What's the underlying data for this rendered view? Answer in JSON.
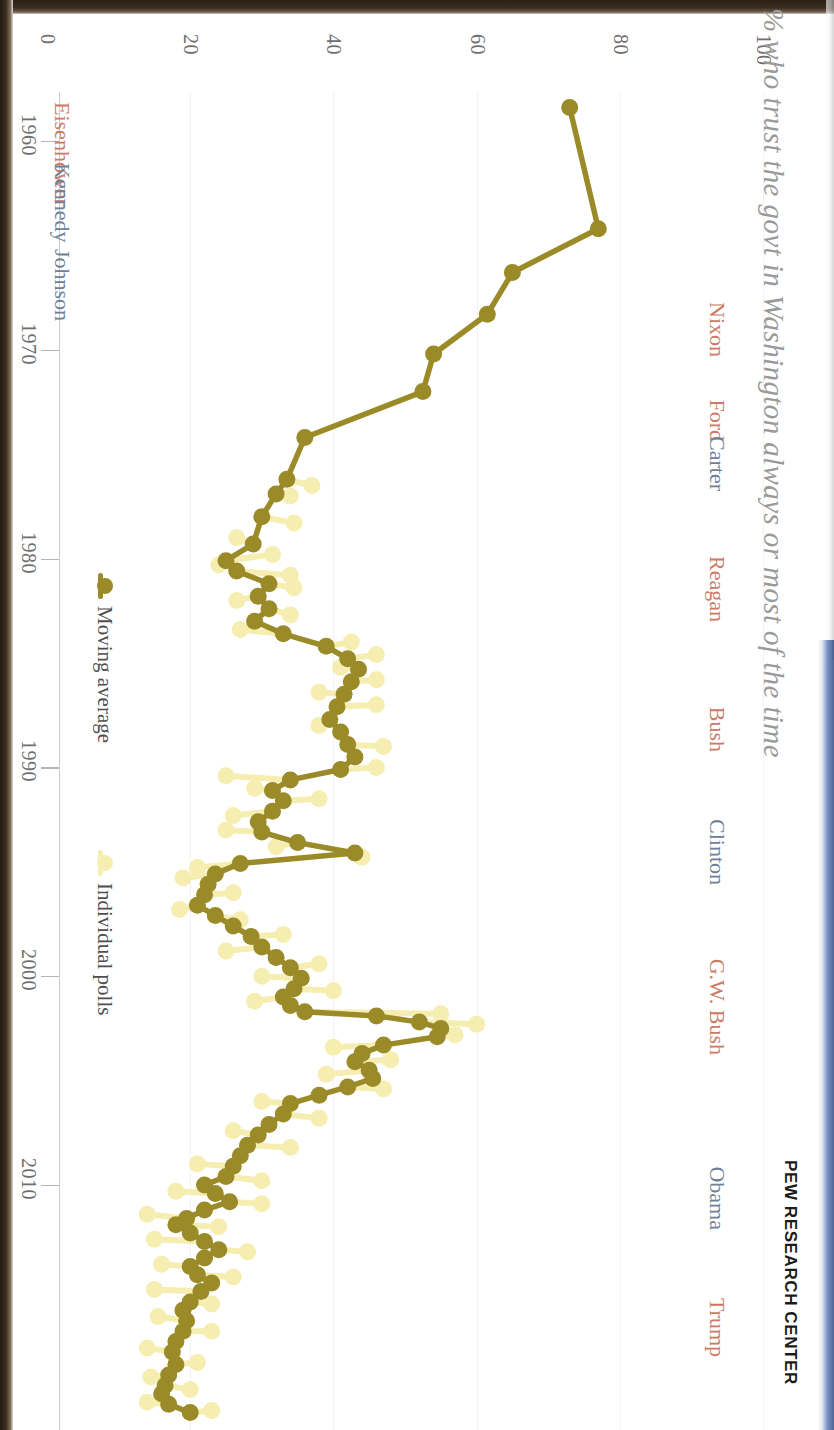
{
  "title": "% who trust the govt in Washington always or most of the time",
  "brand": "PEW RESEARCH CENTER",
  "axes": {
    "pct_ticks": [
      "0",
      "20",
      "40",
      "60",
      "80",
      "100"
    ],
    "year_ticks": [
      "1960",
      "1970",
      "1980",
      "1990",
      "2000",
      "2010"
    ]
  },
  "legend": [
    {
      "label": "Moving average",
      "color": "#9a8a28"
    },
    {
      "label": "Individual polls",
      "color": "#f5eeb0"
    }
  ],
  "presidents": [
    {
      "name": "Eisenhower",
      "party": "rep",
      "color": "#cc7a66",
      "side": "left",
      "year": 1959.4
    },
    {
      "name": "Kennedy",
      "party": "dem",
      "color": "#6e8199",
      "side": "left",
      "year": 1962.3
    },
    {
      "name": "Johnson",
      "party": "dem",
      "color": "#6e8199",
      "side": "left",
      "year": 1966.4
    },
    {
      "name": "Nixon",
      "party": "rep",
      "color": "#cc7a66",
      "side": "right",
      "year": 1971.6
    },
    {
      "name": "Ford",
      "party": "rep",
      "color": "#cc7a66",
      "side": "right",
      "year": 1975.6
    },
    {
      "name": "Carter",
      "party": "dem",
      "color": "#6e8199",
      "side": "right",
      "year": 1978.0
    },
    {
      "name": "Reagan",
      "party": "rep",
      "color": "#cc7a66",
      "side": "right",
      "year": 1984.3
    },
    {
      "name": "Bush",
      "party": "rep",
      "color": "#cc7a66",
      "side": "right",
      "year": 1990.5
    },
    {
      "name": "Clinton",
      "party": "dem",
      "color": "#6e8199",
      "side": "right",
      "year": 1996.9
    },
    {
      "name": "G.W. Bush",
      "party": "rep",
      "color": "#cc7a66",
      "side": "right",
      "year": 2005.0
    },
    {
      "name": "Obama",
      "party": "dem",
      "color": "#6e8199",
      "side": "right",
      "year": 2013.4
    },
    {
      "name": "Trump",
      "party": "rep",
      "color": "#cc7a66",
      "side": "right",
      "year": 2019.5
    }
  ],
  "chart_data": {
    "type": "line",
    "orientation": "rotated-90-clockwise",
    "title": "% who trust the govt in Washington always or most of the time",
    "xlabel": "Year",
    "ylabel": "% who trust the government",
    "xlim": [
      1958,
      2021
    ],
    "ylim": [
      0,
      100
    ],
    "grid": false,
    "legend_position": "left-inside",
    "colors": {
      "moving_average": "#9a8a28",
      "individual_polls": "#f5eeb0",
      "republican_label": "#cc7a66",
      "democrat_label": "#6e8199",
      "axis_text": "#6f6f6f",
      "title_text": "#9a9a9a"
    },
    "series": [
      {
        "name": "Moving average",
        "color": "#9a8a28",
        "points": [
          [
            1958.4,
            73.0
          ],
          [
            1964.2,
            77.0
          ],
          [
            1966.3,
            65.0
          ],
          [
            1968.3,
            61.5
          ],
          [
            1970.2,
            54.0
          ],
          [
            1972.0,
            52.5
          ],
          [
            1974.2,
            36.0
          ],
          [
            1976.2,
            33.5
          ],
          [
            1976.9,
            32.0
          ],
          [
            1978.0,
            30.0
          ],
          [
            1979.3,
            28.8
          ],
          [
            1980.1,
            25.0
          ],
          [
            1980.6,
            26.5
          ],
          [
            1981.2,
            31.0
          ],
          [
            1981.8,
            29.5
          ],
          [
            1982.4,
            31.0
          ],
          [
            1983.0,
            29.0
          ],
          [
            1983.6,
            33.0
          ],
          [
            1984.2,
            39.0
          ],
          [
            1984.8,
            42.0
          ],
          [
            1985.3,
            43.5
          ],
          [
            1985.9,
            42.5
          ],
          [
            1986.5,
            41.5
          ],
          [
            1987.1,
            40.5
          ],
          [
            1987.7,
            39.5
          ],
          [
            1988.3,
            41.0
          ],
          [
            1988.9,
            42.0
          ],
          [
            1989.5,
            43.0
          ],
          [
            1990.1,
            41.0
          ],
          [
            1990.6,
            34.0
          ],
          [
            1991.1,
            31.5
          ],
          [
            1991.6,
            33.0
          ],
          [
            1992.1,
            31.5
          ],
          [
            1992.6,
            29.5
          ],
          [
            1993.1,
            30.0
          ],
          [
            1993.6,
            35.0
          ],
          [
            1994.1,
            43.0
          ],
          [
            1994.6,
            27.0
          ],
          [
            1995.1,
            23.5
          ],
          [
            1995.6,
            22.5
          ],
          [
            1996.1,
            22.0
          ],
          [
            1996.6,
            21.0
          ],
          [
            1997.1,
            23.5
          ],
          [
            1997.6,
            26.0
          ],
          [
            1998.1,
            28.5
          ],
          [
            1998.6,
            30.0
          ],
          [
            1999.1,
            32.0
          ],
          [
            1999.6,
            34.0
          ],
          [
            2000.1,
            35.5
          ],
          [
            2000.6,
            34.5
          ],
          [
            2001.0,
            33.0
          ],
          [
            2001.4,
            34.0
          ],
          [
            2001.7,
            36.0
          ],
          [
            2001.9,
            46.0
          ],
          [
            2002.2,
            52.0
          ],
          [
            2002.5,
            55.0
          ],
          [
            2002.9,
            54.5
          ],
          [
            2003.3,
            47.0
          ],
          [
            2003.7,
            44.0
          ],
          [
            2004.1,
            43.0
          ],
          [
            2004.5,
            45.0
          ],
          [
            2004.9,
            45.5
          ],
          [
            2005.3,
            42.0
          ],
          [
            2005.7,
            38.0
          ],
          [
            2006.1,
            34.0
          ],
          [
            2006.6,
            33.0
          ],
          [
            2007.1,
            31.0
          ],
          [
            2007.6,
            29.5
          ],
          [
            2008.1,
            28.0
          ],
          [
            2008.6,
            27.0
          ],
          [
            2009.1,
            26.0
          ],
          [
            2009.6,
            25.0
          ],
          [
            2010.0,
            22.0
          ],
          [
            2010.4,
            23.5
          ],
          [
            2010.8,
            25.5
          ],
          [
            2011.2,
            22.0
          ],
          [
            2011.6,
            19.5
          ],
          [
            2011.9,
            18.0
          ],
          [
            2012.3,
            20.0
          ],
          [
            2012.7,
            22.0
          ],
          [
            2013.1,
            24.0
          ],
          [
            2013.5,
            22.0
          ],
          [
            2013.9,
            20.0
          ],
          [
            2014.3,
            21.0
          ],
          [
            2014.7,
            23.0
          ],
          [
            2015.1,
            21.5
          ],
          [
            2015.6,
            20.0
          ],
          [
            2016.0,
            19.0
          ],
          [
            2016.5,
            19.5
          ],
          [
            2017.0,
            19.0
          ],
          [
            2017.5,
            18.0
          ],
          [
            2018.0,
            17.5
          ],
          [
            2018.6,
            18.0
          ],
          [
            2019.1,
            17.0
          ],
          [
            2019.6,
            16.5
          ],
          [
            2020.0,
            16.0
          ],
          [
            2020.5,
            17.0
          ],
          [
            2020.9,
            20.0
          ]
        ]
      },
      {
        "name": "Individual polls",
        "color": "#f5eeb0",
        "points": [
          [
            1976.5,
            37.0
          ],
          [
            1977.0,
            34.0
          ],
          [
            1978.3,
            34.5
          ],
          [
            1979.0,
            26.5
          ],
          [
            1979.8,
            31.5
          ],
          [
            1980.3,
            24.0
          ],
          [
            1980.8,
            34.0
          ],
          [
            1981.4,
            34.5
          ],
          [
            1982.0,
            26.5
          ],
          [
            1982.7,
            34.0
          ],
          [
            1983.4,
            27.0
          ],
          [
            1984.0,
            42.5
          ],
          [
            1984.6,
            46.0
          ],
          [
            1985.2,
            41.0
          ],
          [
            1985.8,
            46.0
          ],
          [
            1986.4,
            38.0
          ],
          [
            1987.0,
            46.0
          ],
          [
            1988.0,
            38.0
          ],
          [
            1989.0,
            47.0
          ],
          [
            1990.0,
            46.0
          ],
          [
            1990.4,
            25.0
          ],
          [
            1991.0,
            29.0
          ],
          [
            1991.5,
            38.0
          ],
          [
            1992.3,
            26.0
          ],
          [
            1993.0,
            25.0
          ],
          [
            1993.8,
            32.0
          ],
          [
            1994.3,
            44.0
          ],
          [
            1994.8,
            21.0
          ],
          [
            1995.3,
            19.0
          ],
          [
            1996.0,
            26.0
          ],
          [
            1996.8,
            18.5
          ],
          [
            1997.3,
            27.0
          ],
          [
            1998.0,
            33.0
          ],
          [
            1998.8,
            25.0
          ],
          [
            1999.4,
            38.0
          ],
          [
            2000.0,
            30.0
          ],
          [
            2000.7,
            40.0
          ],
          [
            2001.2,
            29.0
          ],
          [
            2001.8,
            55.0
          ],
          [
            2002.3,
            60.0
          ],
          [
            2002.8,
            57.0
          ],
          [
            2003.4,
            40.0
          ],
          [
            2004.0,
            48.0
          ],
          [
            2004.7,
            39.0
          ],
          [
            2005.4,
            47.0
          ],
          [
            2006.0,
            30.0
          ],
          [
            2006.8,
            38.0
          ],
          [
            2007.4,
            26.0
          ],
          [
            2008.2,
            34.0
          ],
          [
            2009.0,
            21.0
          ],
          [
            2009.8,
            30.0
          ],
          [
            2010.3,
            18.0
          ],
          [
            2010.9,
            30.0
          ],
          [
            2011.4,
            14.0
          ],
          [
            2012.0,
            24.0
          ],
          [
            2012.6,
            15.0
          ],
          [
            2013.2,
            28.0
          ],
          [
            2013.8,
            16.0
          ],
          [
            2014.4,
            26.0
          ],
          [
            2015.0,
            15.0
          ],
          [
            2015.7,
            23.0
          ],
          [
            2016.3,
            15.5
          ],
          [
            2017.0,
            23.0
          ],
          [
            2017.8,
            14.0
          ],
          [
            2018.5,
            21.0
          ],
          [
            2019.2,
            14.5
          ],
          [
            2019.8,
            20.0
          ],
          [
            2020.4,
            14.0
          ],
          [
            2020.8,
            23.0
          ]
        ]
      }
    ]
  }
}
